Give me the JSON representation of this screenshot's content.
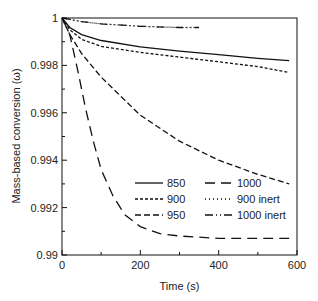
{
  "chart_data": {
    "type": "line",
    "title": "",
    "xlabel": "Time (s)",
    "ylabel": "Mass-based conversion (ω)",
    "xlim": [
      0,
      600
    ],
    "ylim": [
      0.99,
      1.0
    ],
    "xticks": [
      "0",
      "200",
      "400",
      "600"
    ],
    "yticks": [
      "0.99",
      "0.992",
      "0.994",
      "0.996",
      "0.998",
      "1"
    ],
    "grid": false,
    "legend_position": "lower right inside",
    "series": [
      {
        "name": "850",
        "style": "solid",
        "x": [
          0,
          20,
          50,
          100,
          200,
          300,
          400,
          500,
          580
        ],
        "values": [
          1.0,
          0.9996,
          0.9993,
          0.99905,
          0.99878,
          0.9986,
          0.99845,
          0.9983,
          0.9982
        ]
      },
      {
        "name": "900",
        "style": "short-dash",
        "x": [
          0,
          20,
          50,
          100,
          200,
          300,
          400,
          500,
          580
        ],
        "values": [
          1.0,
          0.9995,
          0.9991,
          0.9988,
          0.99855,
          0.99835,
          0.99815,
          0.99795,
          0.9977
        ]
      },
      {
        "name": "950",
        "style": "medium-dash",
        "x": [
          0,
          20,
          50,
          100,
          200,
          300,
          400,
          500,
          580
        ],
        "values": [
          1.0,
          0.9993,
          0.9985,
          0.9975,
          0.9959,
          0.9948,
          0.994,
          0.9934,
          0.993
        ]
      },
      {
        "name": "1000",
        "style": "long-dash",
        "x": [
          0,
          20,
          40,
          60,
          80,
          100,
          130,
          160,
          200,
          250,
          300,
          400,
          500,
          580
        ],
        "values": [
          1.0,
          0.9993,
          0.9978,
          0.9962,
          0.9948,
          0.9936,
          0.9925,
          0.9917,
          0.9912,
          0.9909,
          0.9908,
          0.9907,
          0.9907,
          0.9907
        ]
      },
      {
        "name": "900 inert",
        "style": "dotted",
        "x": [
          0,
          50,
          100,
          200,
          300,
          350
        ],
        "values": [
          1.0,
          0.99985,
          0.99975,
          0.99965,
          0.9996,
          0.9996
        ]
      },
      {
        "name": "1000 inert",
        "style": "dash-dot",
        "x": [
          0,
          50,
          100,
          200,
          300,
          350
        ],
        "values": [
          1.0,
          0.99985,
          0.99975,
          0.99965,
          0.9996,
          0.9996
        ]
      }
    ]
  },
  "legend": {
    "items": [
      {
        "label": "850"
      },
      {
        "label": "1000"
      },
      {
        "label": "900"
      },
      {
        "label": "900 inert"
      },
      {
        "label": "950"
      },
      {
        "label": "1000 inert"
      }
    ]
  }
}
